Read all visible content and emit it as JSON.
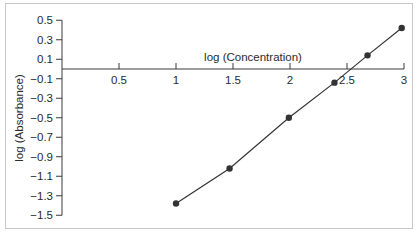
{
  "chart_data": {
    "type": "line",
    "title": "",
    "xlabel": "log (Concentration)",
    "ylabel": "log (Absorbance)",
    "xlim": [
      0,
      3
    ],
    "ylim": [
      -1.5,
      0.5
    ],
    "x_ticks": [
      "0.5",
      "1",
      "1.5",
      "2",
      "2.5",
      "3"
    ],
    "y_ticks": [
      "0.5",
      "0.3",
      "0.1",
      "−0.1",
      "−0.3",
      "−0.5",
      "−0.7",
      "−0.9",
      "−1.1",
      "−1.3",
      "−1.5"
    ],
    "grid": false,
    "legend": null,
    "series": [
      {
        "name": "log (Absorbance)",
        "x": [
          1.0,
          1.47,
          1.99,
          2.39,
          2.68,
          2.98
        ],
        "values": [
          -1.38,
          -1.02,
          -0.5,
          -0.14,
          0.14,
          0.42
        ],
        "markers": true,
        "color": "#333333"
      }
    ]
  }
}
